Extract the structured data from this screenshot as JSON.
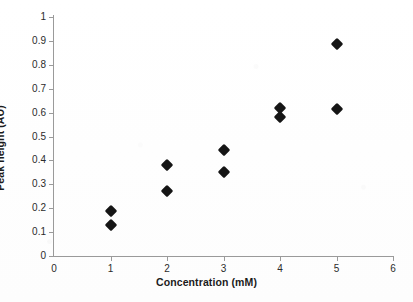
{
  "chart_data": {
    "type": "scatter",
    "title": "",
    "subtitle": "",
    "xlabel": "Concentration (mM)",
    "ylabel": "Peak height (AU)",
    "xlim": [
      0,
      6
    ],
    "ylim": [
      0,
      1
    ],
    "xticks": [
      "0",
      "1",
      "2",
      "3",
      "4",
      "5",
      "6"
    ],
    "xtick_values": [
      0,
      1,
      2,
      3,
      4,
      5,
      6
    ],
    "yticks": [
      "0",
      "0.1",
      "0.2",
      "0.3",
      "0.4",
      "0.5",
      "0.6",
      "0.7",
      "0.8",
      "0.9",
      "1"
    ],
    "ytick_values": [
      0,
      0.1,
      0.2,
      0.3,
      0.4,
      0.5,
      0.6,
      0.7,
      0.8,
      0.9,
      1
    ],
    "grid": false,
    "legend": false,
    "legend_position": "none",
    "marker": "diamond",
    "marker_color": "#151515",
    "axis_color": "#9a9a9a",
    "background_color": "#ffffff",
    "x": [
      1,
      1,
      2,
      2,
      3,
      3,
      4,
      4,
      5,
      5
    ],
    "y": [
      0.19,
      0.13,
      0.38,
      0.27,
      0.445,
      0.35,
      0.62,
      0.58,
      0.885,
      0.615
    ],
    "points": [
      {
        "x": 1,
        "y": 0.19
      },
      {
        "x": 1,
        "y": 0.13
      },
      {
        "x": 2,
        "y": 0.38
      },
      {
        "x": 2,
        "y": 0.27
      },
      {
        "x": 3,
        "y": 0.445
      },
      {
        "x": 3,
        "y": 0.35
      },
      {
        "x": 4,
        "y": 0.62
      },
      {
        "x": 4,
        "y": 0.58
      },
      {
        "x": 5,
        "y": 0.885
      },
      {
        "x": 5,
        "y": 0.615
      }
    ],
    "annotations": []
  }
}
